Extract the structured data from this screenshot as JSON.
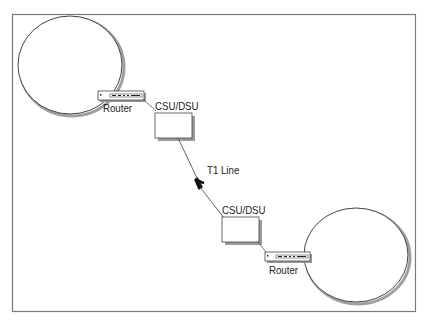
{
  "diagram": {
    "title": "",
    "nodes": [
      {
        "id": "lan-a",
        "type": "network-cloud",
        "label": ""
      },
      {
        "id": "router-a",
        "type": "router",
        "label": "Router"
      },
      {
        "id": "csu-a",
        "type": "csu-dsu",
        "label": "CSU/DSU"
      },
      {
        "id": "csu-b",
        "type": "csu-dsu",
        "label": "CSU/DSU"
      },
      {
        "id": "router-b",
        "type": "router",
        "label": "Router"
      },
      {
        "id": "lan-b",
        "type": "network-cloud",
        "label": ""
      }
    ],
    "edges": [
      {
        "from": "lan-a",
        "to": "router-a",
        "label": ""
      },
      {
        "from": "router-a",
        "to": "csu-a",
        "label": ""
      },
      {
        "from": "csu-a",
        "to": "csu-b",
        "label": "T1 Line"
      },
      {
        "from": "csu-b",
        "to": "router-b",
        "label": ""
      },
      {
        "from": "router-b",
        "to": "lan-b",
        "label": ""
      }
    ],
    "labels": {
      "router_a": "Router",
      "csu_a": "CSU/DSU",
      "t1": "T1 Line",
      "csu_b": "CSU/DSU",
      "router_b": "Router"
    },
    "colors": {
      "line": "#333333",
      "shadow": "#9a9a9a",
      "frame": "#777777"
    }
  }
}
